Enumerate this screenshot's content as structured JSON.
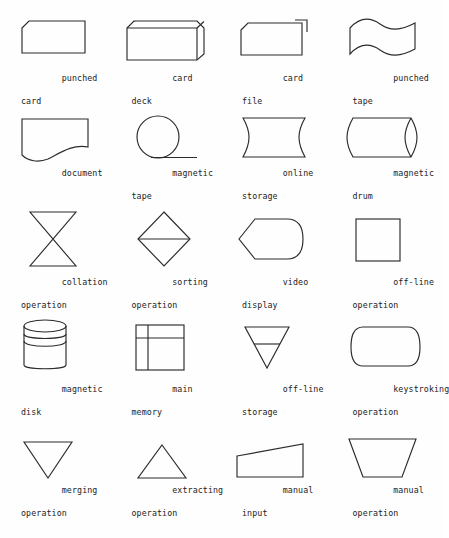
{
  "page": {
    "background_color": "#fefefe",
    "stroke_color": "#2b2b2b",
    "columns": 4,
    "rows": 5
  },
  "symbols": [
    {
      "id": "punched-card",
      "shape": "clipped-corner-rectangle",
      "label_line1": "punched",
      "label_line2": "card"
    },
    {
      "id": "card-deck",
      "shape": "isometric-box",
      "label_line1": "card",
      "label_line2": "deck"
    },
    {
      "id": "card-file",
      "shape": "clipped-corner-rectangle-with-tab",
      "label_line1": "card",
      "label_line2": "file"
    },
    {
      "id": "punched-tape",
      "shape": "wavy-top-and-bottom",
      "label_line1": "punched",
      "label_line2": "tape"
    },
    {
      "id": "document",
      "shape": "wavy-bottom-rectangle",
      "label_line1": "document",
      "label_line2": ""
    },
    {
      "id": "magnetic-tape",
      "shape": "circle-with-tangent",
      "label_line1": "magnetic",
      "label_line2": "tape"
    },
    {
      "id": "online-storage",
      "shape": "concave-sides",
      "label_line1": "online",
      "label_line2": "storage"
    },
    {
      "id": "magnetic-drum",
      "shape": "horizontal-cylinder",
      "label_line1": "magnetic",
      "label_line2": "drum"
    },
    {
      "id": "collation-operation",
      "shape": "hourglass",
      "label_line1": "collation",
      "label_line2": "operation"
    },
    {
      "id": "sorting-operation",
      "shape": "diamond-with-midline",
      "label_line1": "sorting",
      "label_line2": "operation"
    },
    {
      "id": "video-display",
      "shape": "left-point-rounded-right",
      "label_line1": "video",
      "label_line2": "display"
    },
    {
      "id": "off-line-operation",
      "shape": "square",
      "label_line1": "off-line",
      "label_line2": "operation"
    },
    {
      "id": "magnetic-disk",
      "shape": "vertical-cylinder",
      "label_line1": "magnetic",
      "label_line2": "disk"
    },
    {
      "id": "main-memory",
      "shape": "square-with-cross-lines",
      "label_line1": "main",
      "label_line2": "memory"
    },
    {
      "id": "off-line-storage",
      "shape": "down-triangle-with-line",
      "label_line1": "off-line",
      "label_line2": "storage"
    },
    {
      "id": "keystroking-operation",
      "shape": "convex-sides",
      "label_line1": "keystroking",
      "label_line2": "operation"
    },
    {
      "id": "merging-operation",
      "shape": "down-triangle",
      "label_line1": "merging",
      "label_line2": "operation"
    },
    {
      "id": "extracting-operation",
      "shape": "up-triangle",
      "label_line1": "extracting",
      "label_line2": "operation"
    },
    {
      "id": "manual-input",
      "shape": "sloped-top-quadrilateral",
      "label_line1": "manual",
      "label_line2": "input"
    },
    {
      "id": "manual-operation",
      "shape": "inverted-trapezoid",
      "label_line1": "manual",
      "label_line2": "operation"
    }
  ]
}
